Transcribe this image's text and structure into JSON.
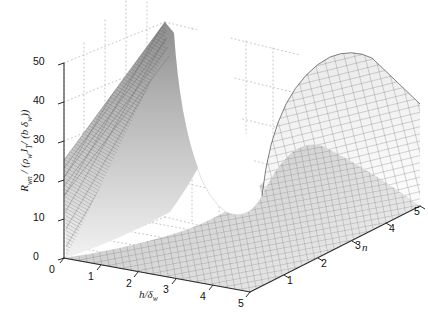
{
  "figure": {
    "kind": "surface-plot-3d",
    "background": "#ffffff",
    "colormap": "grayscale",
    "mesh_color": "#3b3b3b",
    "grid_color": "#b9b9b9",
    "axis_color": "#2b2b2b"
  },
  "axes": {
    "vertical": {
      "label_html": "R<sub>wn</sub> / (&rho;<sub>w</sub>J<sub>T</sub>/ (b &delta;<sub>w</sub>))",
      "label_plain": "R_wn / (rho_w J_T / (b delta_w))",
      "ticks": [
        "0",
        "10",
        "20",
        "30",
        "40",
        "50"
      ],
      "min": 0,
      "max": 50
    },
    "depth": {
      "label_html": "h/&delta;<sub>w</sub>",
      "label_plain": "h/delta_w",
      "ticks": [
        "0",
        "1",
        "2",
        "3",
        "4",
        "5"
      ],
      "min": 0,
      "max": 5
    },
    "horizontal": {
      "label_html": "n",
      "label_plain": "n",
      "ticks": [
        "1",
        "2",
        "3",
        "4",
        "5"
      ],
      "min": 0,
      "max": 5
    }
  },
  "chart_data": {
    "type": "surface",
    "title": "",
    "xlabel": "h/delta_w",
    "ylabel": "n",
    "zlabel": "R_wn / (rho_w J_T / (b delta_w))",
    "xlim": [
      0,
      5
    ],
    "ylim": [
      0,
      5
    ],
    "zlim": [
      0,
      50
    ],
    "grid": true,
    "legend": "none",
    "x_ticks": [
      0,
      1,
      2,
      3,
      4,
      5
    ],
    "y_ticks": [
      1,
      2,
      3,
      4,
      5
    ],
    "z_ticks": [
      0,
      10,
      20,
      30,
      40,
      50
    ],
    "x": [
      0,
      0.5,
      1,
      1.5,
      2,
      2.5,
      3,
      3.5,
      4,
      4.5,
      5
    ],
    "y": [
      0,
      0.5,
      1,
      1.5,
      2,
      2.5,
      3,
      3.5,
      4,
      4.5,
      5
    ],
    "z_rows": [
      [
        50,
        44,
        33,
        24,
        18,
        15,
        15,
        19,
        27,
        35,
        41
      ],
      [
        46,
        39,
        28,
        20,
        14,
        11,
        11,
        15,
        23,
        32,
        39
      ],
      [
        41,
        33,
        23,
        15,
        10,
        7,
        8,
        12,
        20,
        29,
        37
      ],
      [
        35,
        27,
        18,
        11,
        6,
        4,
        5,
        9,
        17,
        27,
        36
      ],
      [
        29,
        21,
        13,
        7,
        4,
        2,
        3,
        7,
        15,
        25,
        35
      ],
      [
        24,
        16,
        9,
        5,
        2,
        1,
        2,
        6,
        14,
        24,
        34
      ],
      [
        19,
        12,
        6,
        3,
        1,
        1,
        2,
        5,
        13,
        24,
        34
      ],
      [
        15,
        9,
        4,
        2,
        1,
        1,
        2,
        6,
        14,
        24,
        35
      ],
      [
        12,
        7,
        3,
        1,
        1,
        1,
        3,
        7,
        15,
        26,
        36
      ],
      [
        10,
        5,
        2,
        1,
        1,
        2,
        4,
        8,
        17,
        28,
        38
      ],
      [
        8,
        4,
        2,
        1,
        2,
        3,
        5,
        10,
        19,
        30,
        40
      ]
    ]
  }
}
